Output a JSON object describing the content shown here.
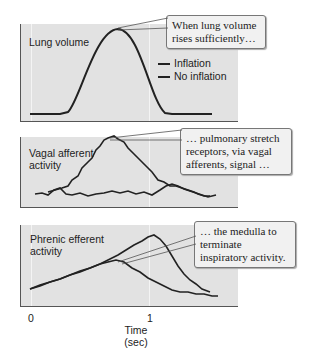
{
  "panels": [
    {
      "label": "Lung volume",
      "callout": "When lung volume rises sufficiently…"
    },
    {
      "label": "Vagal afferent activity",
      "callout": "… pulmonary stretch receptors, via vagal afferents, signal …"
    },
    {
      "label": "Phrenic efferent activity",
      "callout": "… the medulla to terminate inspiratory activity."
    }
  ],
  "legend": {
    "items": [
      {
        "label": "Inflation"
      },
      {
        "label": "No inflation"
      }
    ]
  },
  "x_axis": {
    "ticks": [
      "0",
      "1"
    ],
    "title_line1": "Time",
    "title_line2": "(sec)"
  }
}
